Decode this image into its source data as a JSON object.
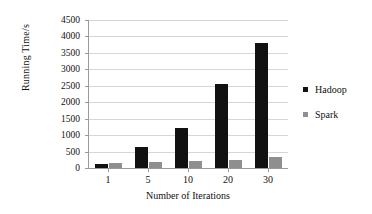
{
  "chart_data": {
    "type": "bar",
    "title": "",
    "xlabel": "Number of Iterations",
    "ylabel": "Running Time/s",
    "categories": [
      "1",
      "5",
      "10",
      "20",
      "30"
    ],
    "series": [
      {
        "name": "Hadoop",
        "color": "#111111",
        "values": [
          120,
          630,
          1230,
          2540,
          3800
        ]
      },
      {
        "name": "Spark",
        "color": "#8f8f8f",
        "values": [
          150,
          190,
          215,
          255,
          325
        ]
      }
    ],
    "ylim": [
      0,
      4500
    ],
    "yticks": [
      0,
      500,
      1000,
      1500,
      2000,
      2500,
      3000,
      3500,
      4000,
      4500
    ],
    "grid": "horizontal",
    "legend_position": "right"
  },
  "legend": {
    "items": [
      {
        "label": "Hadoop",
        "swatch": "hadoop-swatch"
      },
      {
        "label": "Spark",
        "swatch": "spark-swatch"
      }
    ]
  }
}
